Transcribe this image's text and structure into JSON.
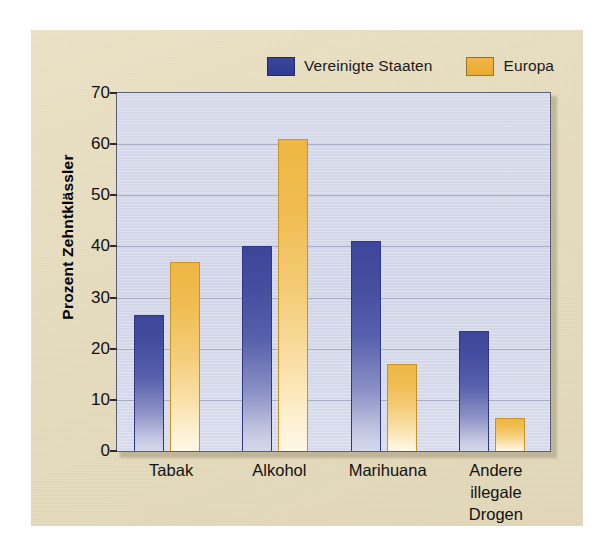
{
  "chart_data": {
    "type": "bar",
    "title": "",
    "subtitle": "",
    "xlabel": "",
    "ylabel": "Prozent Zehntklässler",
    "ylim": [
      0,
      70
    ],
    "ytick_step": 10,
    "yticks": [
      0,
      10,
      20,
      30,
      40,
      50,
      60,
      70
    ],
    "ytick_labels": [
      "0",
      "10",
      "20",
      "30",
      "40",
      "50",
      "60",
      "70"
    ],
    "grid": true,
    "grid_axis": "y",
    "legend_position": "top-right",
    "categories": [
      "Tabak",
      "Alkohol",
      "Marihuana",
      "Andere\nillegale Drogen"
    ],
    "category_labels_flat": [
      "Tabak",
      "Alkohol",
      "Marihuana",
      "Andere illegale Drogen"
    ],
    "series": [
      {
        "name": "Vereinigte Staaten",
        "color": "#3c479c",
        "values": [
          26.5,
          40.0,
          41.0,
          23.5
        ]
      },
      {
        "name": "Europa",
        "color": "#eeb744",
        "values": [
          37.0,
          61.0,
          17.0,
          6.5
        ]
      }
    ],
    "annotations": []
  },
  "legend": {
    "items": [
      {
        "label": "Vereinigte Staaten",
        "swatch": "blue",
        "color": "#3c479c"
      },
      {
        "label": "Europa",
        "swatch": "orange",
        "color": "#eeb744"
      }
    ]
  },
  "colors": {
    "page_background": "#ffffff",
    "paper_background": "#e8dfc4",
    "plot_background": "#d3d6e8",
    "gridline": "#a9aec6",
    "axis": "#2b2b33",
    "series_blue": "#3c479c",
    "series_orange": "#eeb744",
    "text": "#111111"
  }
}
